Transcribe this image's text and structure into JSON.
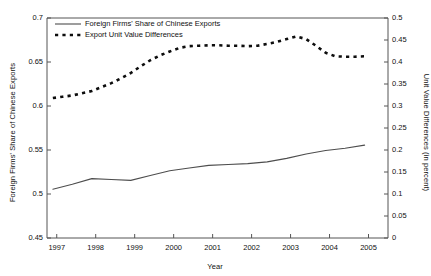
{
  "chart_data": {
    "type": "line",
    "title": "",
    "xlabel": "Year",
    "ylabel": "Foreign Firms' Share of Chinese Exports",
    "ylabel_right": "Unit Value Differences (in percent)",
    "grid": false,
    "legend_position": "top-left",
    "xlim": [
      1996.75,
      2005.5
    ],
    "ylim": [
      0.45,
      0.7
    ],
    "ylim_right": [
      0,
      0.5
    ],
    "xticks": [
      "1997",
      "1998",
      "1999",
      "2000",
      "2001",
      "2002",
      "2003",
      "2004",
      "2005"
    ],
    "yticks_left": [
      "0.45",
      "0.5",
      "0.55",
      "0.6",
      "0.65",
      "0.7"
    ],
    "yticks_right": [
      "0",
      "0.05",
      "0.1",
      "0.15",
      "0.2",
      "0.25",
      "0.3",
      "0.35",
      "0.4",
      "0.45",
      "0.5"
    ],
    "series": [
      {
        "name": "Foreign Firms' Share of Chinese Exports",
        "axis": "left",
        "style": "solid",
        "color": "#4d4d4d",
        "x": [
          1996.9,
          1997.4,
          1997.9,
          1998.4,
          1998.9,
          1999.4,
          1999.9,
          2000.4,
          2000.9,
          2001.4,
          2001.9,
          2002.4,
          2002.9,
          2003.4,
          2003.9,
          2004.4,
          2004.9
        ],
        "values": [
          0.5055,
          0.511,
          0.5175,
          0.5165,
          0.5155,
          0.521,
          0.5265,
          0.5295,
          0.5325,
          0.5335,
          0.5345,
          0.5365,
          0.5405,
          0.5455,
          0.5495,
          0.552,
          0.5555
        ]
      },
      {
        "name": "Export Unit Value Differences",
        "axis": "right",
        "style": "dashed",
        "color": "#0d0d0d",
        "x": [
          1996.9,
          1997.15,
          1997.4,
          1997.65,
          1997.9,
          1998.15,
          1998.4,
          1998.65,
          1998.9,
          1999.15,
          1999.4,
          1999.65,
          1999.9,
          2000.15,
          2000.4,
          2000.65,
          2000.9,
          2001.15,
          2001.4,
          2001.65,
          2001.9,
          2002.15,
          2002.4,
          2002.65,
          2002.9,
          2003.15,
          2003.4,
          2003.65,
          2003.9,
          2004.15,
          2004.4,
          2004.65,
          2004.9
        ],
        "values": [
          0.318,
          0.321,
          0.324,
          0.329,
          0.334,
          0.343,
          0.352,
          0.363,
          0.375,
          0.39,
          0.404,
          0.415,
          0.424,
          0.432,
          0.436,
          0.437,
          0.438,
          0.438,
          0.437,
          0.437,
          0.436,
          0.437,
          0.441,
          0.446,
          0.452,
          0.458,
          0.452,
          0.437,
          0.421,
          0.413,
          0.412,
          0.412,
          0.413
        ]
      }
    ],
    "legend": [
      {
        "label": "Foreign Firms' Share of Chinese Exports",
        "style": "solid"
      },
      {
        "label": "Export Unit Value Differences",
        "style": "dashed"
      }
    ]
  },
  "colors": {
    "axis": "#555555",
    "text": "#111111",
    "solid_series": "#4d4d4d",
    "dashed_series": "#0d0d0d",
    "background": "#ffffff"
  }
}
